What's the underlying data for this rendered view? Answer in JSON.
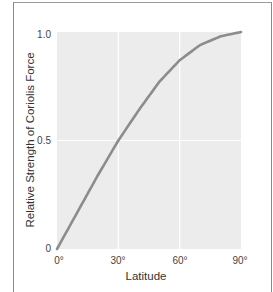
{
  "chart_data": {
    "type": "line",
    "title": "",
    "xlabel": "Latitude",
    "ylabel": "Relative Strength of Coriolis Force",
    "x_ticks": [
      "0°",
      "30°",
      "60°",
      "90°"
    ],
    "y_ticks": [
      "0",
      "0.5",
      "1.0"
    ],
    "xlim": [
      0,
      90
    ],
    "ylim": [
      0,
      1.0
    ],
    "grid": true,
    "legend": null,
    "series": [
      {
        "name": "Relative Strength of Coriolis Force",
        "x": [
          0,
          10,
          20,
          30,
          40,
          50,
          60,
          70,
          80,
          90
        ],
        "values": [
          0,
          0.17,
          0.34,
          0.5,
          0.64,
          0.77,
          0.87,
          0.94,
          0.98,
          1.0
        ]
      }
    ],
    "colors": {
      "line": "#8c8c8c",
      "plot_bg": "#ececec",
      "grid": "#ffffff"
    }
  }
}
